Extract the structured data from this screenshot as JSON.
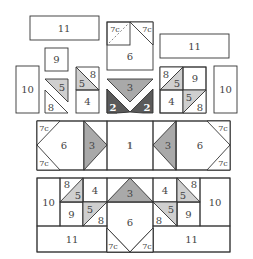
{
  "diagram": {
    "colors": {
      "background": "#ffffff",
      "plain": "#ffffff",
      "light_print": "#ececec",
      "medium_gray": "#a9a9a9",
      "dark_gray": "#5a5a5a",
      "plaid": "#8a8a8a",
      "floral": "#d9d9d9",
      "light_triangle": "#cfcfcf",
      "outline": "#333333"
    },
    "labels": {
      "p1": "1",
      "p2": "2",
      "p3": "3",
      "p4": "4",
      "p5": "5",
      "p6": "6",
      "p7c": "7c",
      "p8": "8",
      "p9": "9",
      "p10": "10",
      "p11": "11"
    },
    "sections": [
      {
        "name": "top-exploded-row",
        "pieces": [
          "11",
          "9",
          "10",
          "5",
          "8",
          "8",
          "5",
          "4",
          "7c",
          "7c",
          "6",
          "3",
          "2",
          "2",
          "11",
          "8",
          "5",
          "9",
          "4",
          "5",
          "8",
          "10"
        ]
      },
      {
        "name": "middle-row",
        "pieces": [
          "7c",
          "7c",
          "6",
          "2",
          "3",
          "2",
          "1",
          "2",
          "3",
          "2",
          "6",
          "7c",
          "7c"
        ]
      },
      {
        "name": "bottom-row",
        "pieces": [
          "10",
          "8",
          "5",
          "4",
          "9",
          "5",
          "8",
          "2",
          "3",
          "2",
          "6",
          "7c",
          "7c",
          "4",
          "8",
          "5",
          "5",
          "8",
          "9",
          "10",
          "11",
          "11"
        ]
      }
    ]
  }
}
